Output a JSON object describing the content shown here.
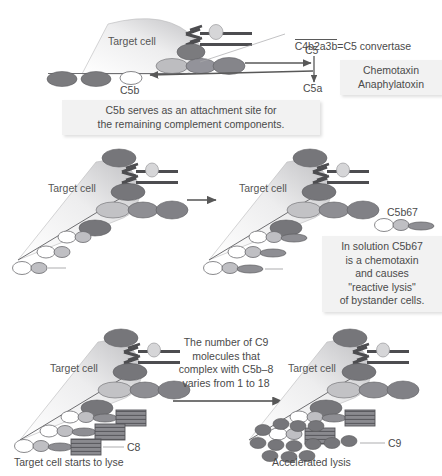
{
  "figure": {
    "type": "diagram"
  },
  "colors": {
    "dark_ellipse": "#77777a",
    "mid_ellipse": "#9a9a9e",
    "light_ellipse": "#c9c9cc",
    "white_ellipse": "#ffffff",
    "outline": "#5a5a5a",
    "cell_gradient_light": "#fbfbfb",
    "cell_gradient_dark": "#c2c2c4",
    "caption_bg": "#f2f2f2",
    "text": "#4a4a4a"
  },
  "panel1": {
    "cell_label": "Target cell",
    "equation_left": "C4b2a3b",
    "equation_equals": "=",
    "equation_right": "C5 convertase",
    "label_c5": "C5",
    "label_c5a": "C5a",
    "label_c5b": "C5b",
    "side_note": "Chemotaxin\nAnaphylatoxin",
    "caption": "C5b serves as an attachment site for\nthe remaining complement components."
  },
  "panel2": {
    "cell_label_left": "Target cell",
    "cell_label_right": "Target cell",
    "label_c6": "C6",
    "label_c7": "C7",
    "label_c5b67": "C5b67",
    "caption": "In solution C5b67\nis a chemotaxin\nand causes\n\"reactive lysis\"\nof bystander cells."
  },
  "panel3": {
    "cell_label_left": "Target cell",
    "cell_label_right": "Target cell",
    "label_c8": "C8",
    "label_c9": "C9",
    "center_note": "The number of C9\nmolecules that\ncomplex with C5b–8\nvaries from 1 to 18",
    "footer_left": "Target cell starts to lyse",
    "footer_right": "Accelerated lysis"
  },
  "icons": {
    "target_cell": "target-cell-wedge-icon",
    "antibody": "antibody-y-icon",
    "arrow": "arrow-right-icon",
    "c8_block": "c8-striped-block-icon"
  }
}
